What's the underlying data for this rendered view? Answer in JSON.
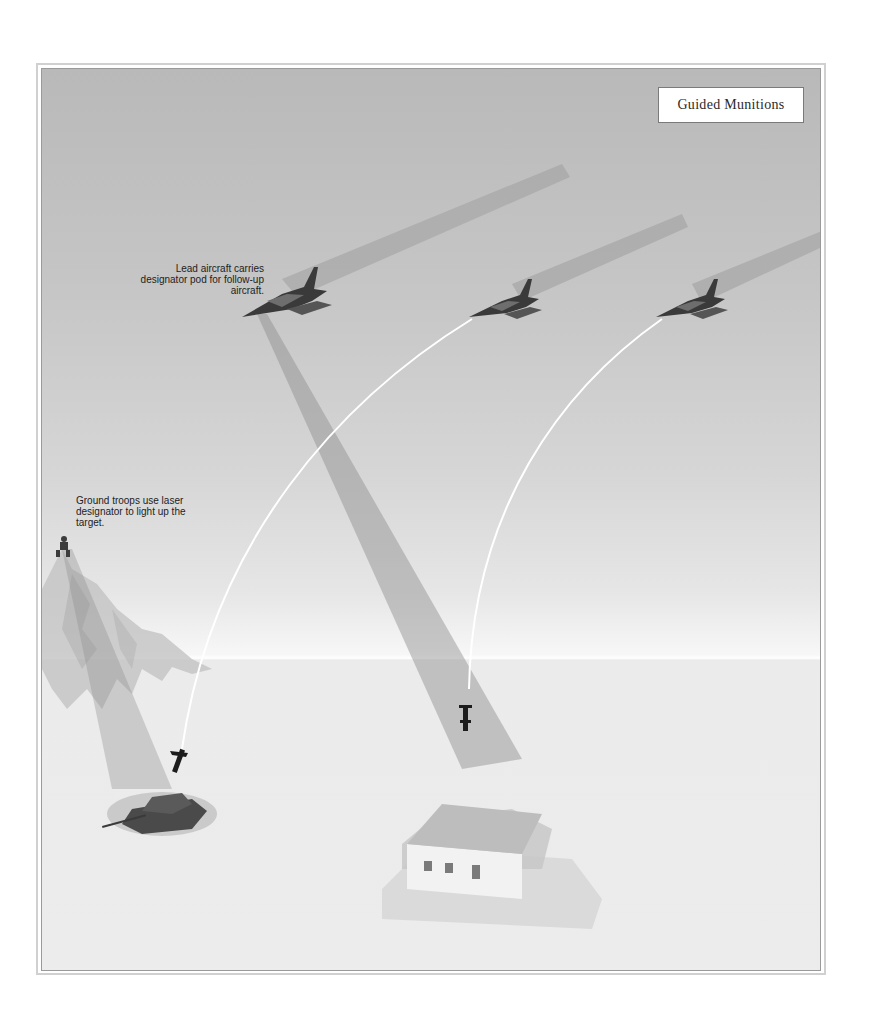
{
  "title": "Guided Munitions",
  "captions": {
    "lead_aircraft": "Lead aircraft carries designator pod for follow-up aircraft.",
    "ground_troops": "Ground troops use laser designator to light up the target."
  },
  "elements": {
    "aircraft": [
      "lead-aircraft",
      "follow-up-aircraft-1",
      "follow-up-aircraft-2"
    ],
    "targets": [
      "tank",
      "building"
    ],
    "munitions": [
      "bomb-on-tank",
      "bomb-on-building"
    ],
    "designators": [
      "ground-troop-laser-beam",
      "lead-aircraft-laser-beam"
    ]
  },
  "colors": {
    "sky_top": "#b9b9b9",
    "horizon": "#ffffff",
    "ground": "#ececec",
    "aircraft": "#3a3a3a",
    "beam": "#9a9a9a",
    "trajectory": "#ffffff"
  }
}
